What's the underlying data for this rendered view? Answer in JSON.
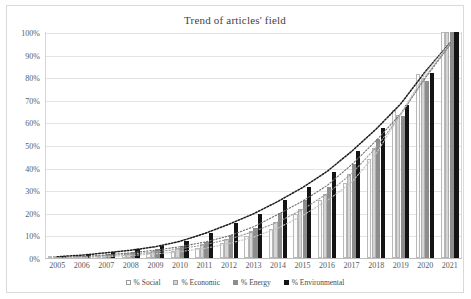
{
  "chart_data": {
    "type": "bar",
    "title": "Trend of articles' field",
    "xlabel": "",
    "ylabel": "",
    "ylim": [
      0,
      100
    ],
    "grid": true,
    "legend_position": "bottom",
    "categories": [
      "2005",
      "2006",
      "2007",
      "2008",
      "2009",
      "2010",
      "2011",
      "2012",
      "2013",
      "2014",
      "2015",
      "2016",
      "2017",
      "2018",
      "2019",
      "2020",
      "2021"
    ],
    "ytick_labels": [
      "0%",
      "10%",
      "20%",
      "30%",
      "40%",
      "50%",
      "60%",
      "70%",
      "80%",
      "90%",
      "100%"
    ],
    "ytick_values": [
      0,
      10,
      20,
      30,
      40,
      50,
      60,
      70,
      80,
      90,
      100
    ],
    "series": [
      {
        "name": "% Social",
        "color": "#fbfbfb",
        "values": [
          0.3,
          0.6,
          1.0,
          1.5,
          2.2,
          3.2,
          4.5,
          6.5,
          9.8,
          12.8,
          19.3,
          25.5,
          33.0,
          44.0,
          65.5,
          81.5,
          100.0
        ]
      },
      {
        "name": "% Economic",
        "color": "#d5d5d5",
        "values": [
          0.4,
          0.8,
          1.4,
          2.1,
          3.0,
          4.4,
          6.1,
          8.5,
          12.0,
          16.0,
          21.5,
          28.5,
          37.0,
          48.5,
          63.5,
          79.5,
          100.0
        ]
      },
      {
        "name": "% Energy",
        "color": "#8d8d8d",
        "values": [
          0.5,
          1.0,
          1.8,
          2.7,
          3.8,
          5.3,
          7.3,
          10.0,
          13.5,
          20.0,
          25.5,
          31.5,
          41.5,
          52.5,
          63.0,
          78.5,
          100.0
        ]
      },
      {
        "name": "% Environmental",
        "color": "#141414",
        "values": [
          0.8,
          1.6,
          2.8,
          3.8,
          5.2,
          7.5,
          11.0,
          15.5,
          19.5,
          25.5,
          31.5,
          38.0,
          47.5,
          57.5,
          67.5,
          82.0,
          100.0
        ]
      }
    ],
    "trendlines": [
      {
        "name": "% Environmental trend",
        "color": "#1a1a1a",
        "style": "dotted"
      },
      {
        "name": "% Energy trend",
        "color": "#707070",
        "style": "dotted"
      },
      {
        "name": "% Economic trend",
        "color": "#9a9a9a",
        "style": "dotted"
      },
      {
        "name": "% Social trend",
        "color": "#c4c4c4",
        "style": "dotted"
      }
    ]
  }
}
